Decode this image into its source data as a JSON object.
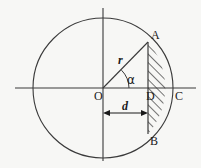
{
  "figure": {
    "type": "geometry-diagram",
    "background_color": "#f7f7f5",
    "stroke_color": "#3a3a3a",
    "hatch_color": "#2b2b2b"
  },
  "geometry": {
    "center": {
      "x": 103,
      "y": 88
    },
    "radius": 70,
    "chord_x": 148,
    "d_value_px": 45,
    "point_A": {
      "x": 148,
      "y": 42
    },
    "point_B": {
      "x": 148,
      "y": 134
    },
    "point_C": {
      "x": 173,
      "y": 88
    },
    "point_D": {
      "x": 148,
      "y": 88
    },
    "alpha_deg": 41,
    "x_axis": {
      "x1": 15,
      "x2": 196,
      "y": 88
    },
    "y_axis": {
      "x": 103,
      "y1": 8,
      "y2": 161
    },
    "dim_arrow": {
      "x1": 104,
      "x2": 147,
      "y": 113
    }
  },
  "labels": {
    "point_a": "A",
    "point_b": "B",
    "point_c": "C",
    "point_d": "D",
    "origin": "O",
    "radius": "r",
    "distance": "d",
    "angle": "α"
  }
}
